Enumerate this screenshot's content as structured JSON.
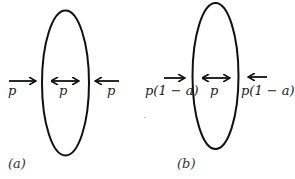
{
  "diagram": {
    "panels": [
      {
        "caption": "(a)",
        "left_label": "p",
        "center_label": "p",
        "right_label": "p"
      },
      {
        "caption": "(b)",
        "left_label": "p(1 − a)",
        "center_label": "p",
        "right_label": "p(1 − a)"
      }
    ],
    "colors": {
      "stroke": "#111111",
      "text": "#222222",
      "background": "#ffffff"
    }
  }
}
